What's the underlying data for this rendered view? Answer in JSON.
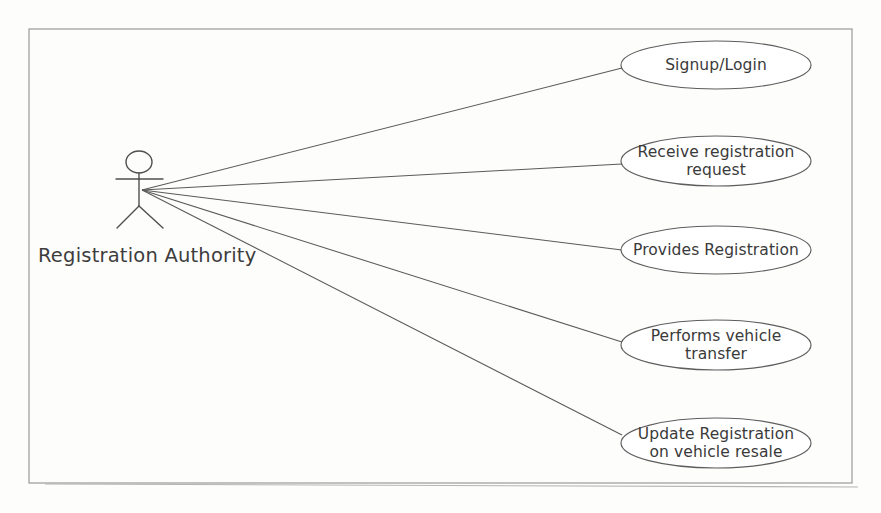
{
  "diagram": {
    "kind": "uml-use-case-diagram",
    "background_color": "#fdfdfc",
    "frame": {
      "x": 29,
      "y": 29,
      "width": 823,
      "height": 454,
      "border_color": "#9a9a9a"
    },
    "line_color": "#5a5a5a",
    "shape_stroke_color": "#5d5d5d",
    "shape_fill_color": "#ffffff",
    "text_color": "#3a3a3a"
  },
  "actor": {
    "label": "Registration Authority",
    "label_x": 38,
    "label_y": 262,
    "head_cx": 139,
    "head_cy": 162,
    "head_rx": 13,
    "head_ry": 11,
    "neck_y": 173,
    "arms_y": 179,
    "arms_x1": 116,
    "arms_x2": 163,
    "hip_y": 206,
    "body_x": 139,
    "leg_left_x": 117,
    "leg_right_x": 163,
    "feet_y": 228,
    "connect_x": 142,
    "connect_y": 190
  },
  "use_cases": [
    {
      "id": "signup-login",
      "lines": [
        "Signup/Login"
      ],
      "cx": 716,
      "cy": 65,
      "rx": 95,
      "ry": 24,
      "anchor_x": 622,
      "anchor_y": 68
    },
    {
      "id": "receive-registration-request",
      "lines": [
        "Receive registration",
        "request"
      ],
      "cx": 716,
      "cy": 161,
      "rx": 95,
      "ry": 25,
      "anchor_x": 622,
      "anchor_y": 164
    },
    {
      "id": "provides-registration",
      "lines": [
        "Provides Registration"
      ],
      "cx": 716,
      "cy": 250,
      "rx": 95,
      "ry": 24,
      "anchor_x": 622,
      "anchor_y": 250
    },
    {
      "id": "performs-vehicle-transfer",
      "lines": [
        "Performs vehicle",
        "transfer"
      ],
      "cx": 716,
      "cy": 345,
      "rx": 95,
      "ry": 25,
      "anchor_x": 622,
      "anchor_y": 342
    },
    {
      "id": "update-registration-on-vehicle-resale",
      "lines": [
        "Update Registration",
        "on vehicle resale"
      ],
      "cx": 716,
      "cy": 443,
      "rx": 95,
      "ry": 25,
      "anchor_x": 622,
      "anchor_y": 435
    }
  ],
  "stray_rule": {
    "x1": 45,
    "y1": 484,
    "x2": 858,
    "y2": 487
  }
}
